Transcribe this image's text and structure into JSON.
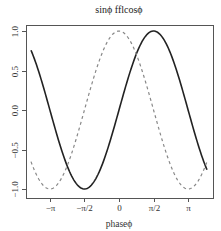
{
  "chart_data": {
    "type": "line",
    "title": "sinϕ fflcosϕ",
    "xlabel": "phaseϕ",
    "ylabel": "",
    "xlim": [
      -4.32,
      4.32
    ],
    "ylim": [
      -1.08,
      1.08
    ],
    "grid": false,
    "legend": null,
    "x_ticks": [
      {
        "value": -3.14159,
        "label": "−π"
      },
      {
        "value": -1.5708,
        "label": "−π/2"
      },
      {
        "value": 0,
        "label": "0"
      },
      {
        "value": 1.5708,
        "label": "π/2"
      },
      {
        "value": 3.14159,
        "label": "π"
      }
    ],
    "y_ticks": [
      {
        "value": -1.0,
        "label": "−1.0"
      },
      {
        "value": -0.5,
        "label": "−0.5"
      },
      {
        "value": 0.0,
        "label": "0.0"
      },
      {
        "value": 0.5,
        "label": "0.5"
      },
      {
        "value": 1.0,
        "label": "1.0"
      }
    ],
    "x_range": [
      -4,
      4
    ],
    "series": [
      {
        "name": "sin",
        "function": "sin(x)",
        "style": "solid",
        "color": "#222222",
        "width": 1.6,
        "x": [
          -4,
          -3.5,
          -3,
          -2.5,
          -2,
          -1.5708,
          -1,
          -0.5,
          0,
          0.5,
          1,
          1.5708,
          2,
          2.5,
          3,
          3.5,
          4
        ],
        "values": [
          0.757,
          0.351,
          -0.141,
          -0.598,
          -0.909,
          -1.0,
          -0.841,
          -0.479,
          0.0,
          0.479,
          0.841,
          1.0,
          0.909,
          0.598,
          0.141,
          -0.351,
          -0.757
        ]
      },
      {
        "name": "cos",
        "function": "cos(x)",
        "style": "dashed",
        "color": "#888888",
        "width": 1.2,
        "x": [
          -4,
          -3.5,
          -3.14159,
          -3,
          -2.5,
          -2,
          -1.5,
          -1,
          -0.5,
          0,
          0.5,
          1,
          1.5,
          2,
          2.5,
          3,
          3.14159,
          3.5,
          4
        ],
        "values": [
          -0.654,
          -0.936,
          -1.0,
          -0.99,
          -0.801,
          -0.416,
          0.071,
          0.54,
          0.878,
          1.0,
          0.878,
          0.54,
          0.071,
          -0.416,
          -0.801,
          -0.99,
          -1.0,
          -0.936,
          -0.654
        ]
      }
    ]
  },
  "layout": {
    "plot_box": {
      "left": 26,
      "top": 25,
      "right": 213,
      "bottom": 198
    },
    "x_origin_px": 119,
    "x_scale_px_per_unit": 22,
    "y_origin_px": 110,
    "y_scale_px_per_unit": 79
  }
}
